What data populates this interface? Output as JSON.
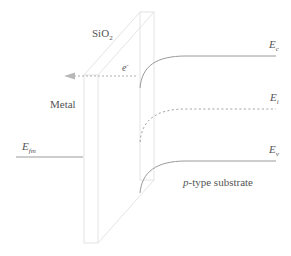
{
  "diagram": {
    "type": "MOS band diagram (metal / SiO2 / p-type substrate)",
    "labels": {
      "oxide": "SiO",
      "oxide_sub": "2",
      "metal": "Metal",
      "electron": "e",
      "electron_sup": "-",
      "efm": "E",
      "efm_sub": "fm",
      "ec": "E",
      "ec_sub": "c",
      "ei": "E",
      "ei_sub": "i",
      "ev": "E",
      "ev_sub": "v",
      "substrate_italic": "p",
      "substrate_rest": "-type substrate"
    },
    "colors": {
      "band_line": "#9a9a9a",
      "oxide_outline": "#e4e4e4",
      "arrow": "#b0b0b0",
      "text": "#555555"
    },
    "bands": [
      {
        "name": "Ec",
        "style": "solid",
        "y_bulk": 56,
        "bends_down_to": 88
      },
      {
        "name": "Ei",
        "style": "dotted",
        "y_bulk": 108,
        "bends_down_to": 142
      },
      {
        "name": "Ev",
        "style": "solid",
        "y_bulk": 160,
        "bends_down_to": 193
      },
      {
        "name": "Efm",
        "style": "solid",
        "y": 157,
        "side": "metal"
      }
    ],
    "arrow": {
      "direction": "left",
      "style": "dashed",
      "label": "e-"
    }
  }
}
